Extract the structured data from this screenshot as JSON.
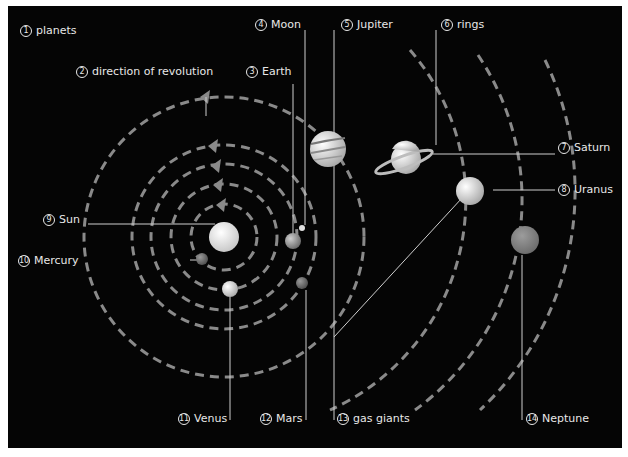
{
  "diagram": {
    "title": "planets",
    "labels": [
      {
        "id": 1,
        "text": "planets"
      },
      {
        "id": 2,
        "text": "direction of revolution"
      },
      {
        "id": 3,
        "text": "Earth"
      },
      {
        "id": 4,
        "text": "Moon"
      },
      {
        "id": 5,
        "text": "Jupiter"
      },
      {
        "id": 6,
        "text": "rings"
      },
      {
        "id": 7,
        "text": "Saturn"
      },
      {
        "id": 8,
        "text": "Uranus"
      },
      {
        "id": 9,
        "text": "Sun"
      },
      {
        "id": 10,
        "text": "Mercury"
      },
      {
        "id": 11,
        "text": "Venus"
      },
      {
        "id": 12,
        "text": "Mars"
      },
      {
        "id": 13,
        "text": "gas giants"
      },
      {
        "id": 14,
        "text": "Neptune"
      }
    ],
    "colors": {
      "background": "#050505",
      "orbit": "#8a8a8a",
      "label_text": "#e8e8e8",
      "leader_line": "#cfcfcf"
    }
  }
}
